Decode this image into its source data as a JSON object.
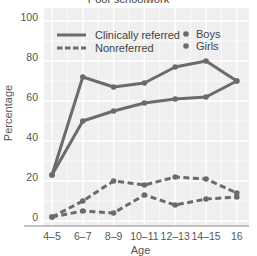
{
  "chart_data": {
    "type": "line",
    "title": "Poor schoolwork",
    "xlabel": "Age",
    "ylabel": "Percentage",
    "ylim": [
      0,
      100
    ],
    "yticks": [
      0,
      20,
      40,
      60,
      80,
      100
    ],
    "categories": [
      "4–5",
      "6–7",
      "8–9",
      "10–11",
      "12–13",
      "14–15",
      "16"
    ],
    "grid": true,
    "legend": {
      "position": "top-left inside",
      "line_styles": [
        {
          "label": "Clinically referred",
          "style": "solid"
        },
        {
          "label": "Nonreferred",
          "style": "dashed"
        }
      ],
      "markers": [
        {
          "label": "Boys"
        },
        {
          "label": "Girls"
        }
      ]
    },
    "series": [
      {
        "name": "Clinically referred – Boys",
        "style": "solid",
        "values": [
          21,
          70,
          65,
          67,
          75,
          78,
          68
        ]
      },
      {
        "name": "Clinically referred – Girls",
        "style": "solid",
        "values": [
          21,
          48,
          53,
          57,
          59,
          60,
          68
        ]
      },
      {
        "name": "Nonreferred – Boys",
        "style": "dashed",
        "values": [
          0,
          8,
          18,
          16,
          20,
          19,
          12
        ]
      },
      {
        "name": "Nonreferred – Girls",
        "style": "dashed",
        "values": [
          0,
          3,
          2,
          11,
          6,
          9,
          10
        ]
      }
    ],
    "colors": {
      "line": "#6b6b6b",
      "background": "#efefef",
      "grid": "#ffffff",
      "axis": "#8a8a8a"
    }
  }
}
